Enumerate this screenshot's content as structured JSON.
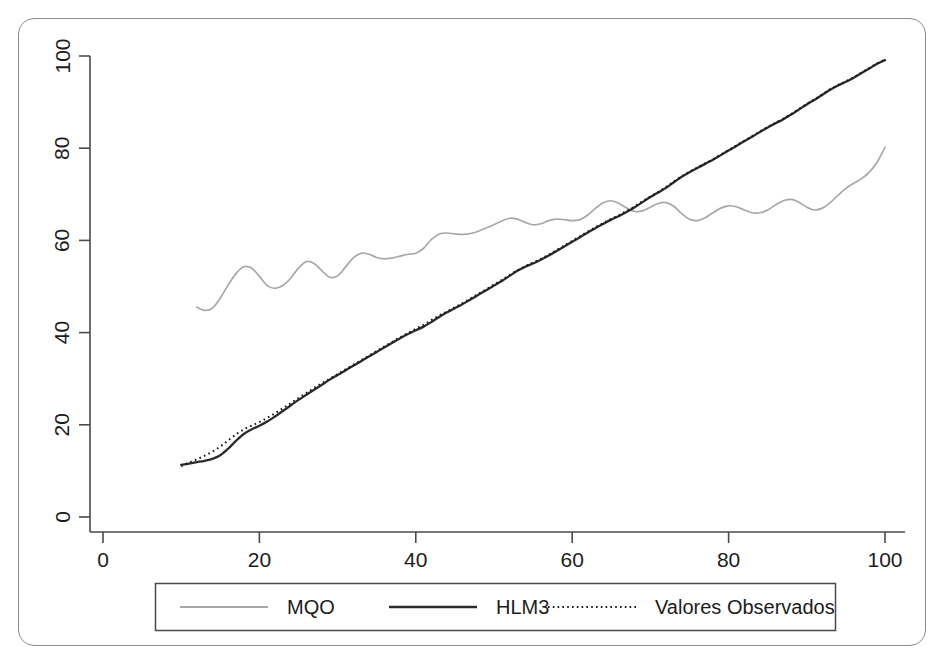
{
  "figure": {
    "background_color": "#ffffff",
    "border_color": "#8d8f92",
    "has_rounded_border": true
  },
  "chart_data": {
    "type": "line",
    "title": "",
    "subtitle": "",
    "xlabel": "",
    "ylabel": "",
    "xlim": [
      0,
      104
    ],
    "ylim": [
      -1,
      103
    ],
    "xticks": [
      0,
      20,
      40,
      60,
      80,
      100
    ],
    "yticks": [
      0,
      20,
      40,
      60,
      80,
      100
    ],
    "xtick_labels": [
      "0",
      "20",
      "40",
      "60",
      "80",
      "100"
    ],
    "ytick_labels": [
      "0",
      "20",
      "40",
      "60",
      "80",
      "100"
    ],
    "grid": false,
    "legend_position": "bottom-outside",
    "legend_entries": [
      "MQO",
      "HLM3",
      "Valores Observados"
    ],
    "series": [
      {
        "name": "MQO",
        "color": "#a8a8a8",
        "style": "solid",
        "x": [
          12.0,
          13.0,
          14.0,
          15.0,
          16.0,
          17.0,
          18.0,
          19.0,
          20.0,
          21.0,
          22.0,
          23.0,
          24.0,
          25.0,
          26.0,
          27.0,
          28.0,
          29.0,
          30.0,
          31.0,
          32.0,
          33.0,
          34.0,
          35.0,
          36.0,
          37.0,
          38.0,
          39.0,
          40.0,
          41.0,
          42.0,
          43.0,
          44.0,
          45.0,
          46.0,
          47.0,
          48.0,
          49.0,
          50.0,
          51.0,
          52.0,
          53.0,
          54.0,
          55.0,
          56.0,
          57.0,
          58.0,
          59.0,
          60.0,
          61.0,
          62.0,
          63.0,
          64.0,
          65.0,
          66.0,
          67.0,
          68.0,
          69.0,
          70.0,
          71.0,
          72.0,
          73.0,
          74.0,
          75.0,
          76.0,
          77.0,
          78.0,
          79.0,
          80.0,
          81.0,
          82.0,
          83.0,
          84.0,
          85.0,
          86.0,
          87.0,
          88.0,
          89.0,
          90.0,
          91.0,
          92.0,
          93.0,
          94.0,
          95.0,
          96.0,
          97.0,
          98.0,
          99.0,
          100.0
        ],
        "y": [
          45.5,
          44.8,
          45.3,
          47.5,
          50.3,
          52.8,
          54.3,
          54.0,
          52.2,
          50.2,
          49.6,
          50.2,
          51.8,
          54.0,
          55.4,
          55.0,
          53.4,
          52.0,
          52.3,
          54.2,
          56.2,
          57.2,
          57.0,
          56.3,
          56.0,
          56.2,
          56.6,
          57.0,
          57.2,
          58.3,
          60.2,
          61.4,
          61.6,
          61.4,
          61.3,
          61.5,
          62.0,
          62.7,
          63.4,
          64.2,
          64.8,
          64.6,
          63.9,
          63.4,
          63.6,
          64.3,
          64.6,
          64.5,
          64.3,
          64.5,
          65.5,
          67.0,
          68.2,
          68.6,
          68.0,
          67.0,
          66.3,
          66.4,
          67.2,
          68.0,
          68.2,
          67.4,
          65.8,
          64.6,
          64.3,
          64.9,
          66.0,
          67.0,
          67.5,
          67.3,
          66.6,
          66.0,
          66.0,
          66.6,
          67.7,
          68.6,
          68.9,
          68.3,
          67.2,
          66.6,
          67.0,
          68.2,
          69.8,
          71.3,
          72.4,
          73.4,
          74.8,
          77.0,
          80.2
        ]
      },
      {
        "name": "HLM3",
        "color": "#2b2b2b",
        "style": "solid",
        "x": [
          10.0,
          11.0,
          12.0,
          13.0,
          14.0,
          15.0,
          16.0,
          17.0,
          18.0,
          19.0,
          20.0,
          21.0,
          22.0,
          23.0,
          24.0,
          25.0,
          26.0,
          27.0,
          28.0,
          29.0,
          30.0,
          31.0,
          32.0,
          33.0,
          34.0,
          35.0,
          36.0,
          37.0,
          38.0,
          39.0,
          40.0,
          41.0,
          42.0,
          43.0,
          44.0,
          45.0,
          46.0,
          47.0,
          48.0,
          49.0,
          50.0,
          51.0,
          52.0,
          53.0,
          54.0,
          55.0,
          56.0,
          57.0,
          58.0,
          59.0,
          60.0,
          61.0,
          62.0,
          63.0,
          64.0,
          65.0,
          66.0,
          67.0,
          68.0,
          69.0,
          70.0,
          71.0,
          72.0,
          73.0,
          74.0,
          75.0,
          76.0,
          77.0,
          78.0,
          79.0,
          80.0,
          81.0,
          82.0,
          83.0,
          84.0,
          85.0,
          86.0,
          87.0,
          88.0,
          89.0,
          90.0,
          91.0,
          92.0,
          93.0,
          94.0,
          95.0,
          96.0,
          97.0,
          98.0,
          99.0,
          100.0
        ],
        "y": [
          11.3,
          11.6,
          11.9,
          12.2,
          12.6,
          13.4,
          14.8,
          16.5,
          18.0,
          19.0,
          19.8,
          20.7,
          21.8,
          23.0,
          24.2,
          25.4,
          26.5,
          27.6,
          28.7,
          29.8,
          30.8,
          31.8,
          32.8,
          33.8,
          34.8,
          35.8,
          36.8,
          37.8,
          38.8,
          39.7,
          40.5,
          41.3,
          42.3,
          43.4,
          44.4,
          45.3,
          46.2,
          47.2,
          48.2,
          49.2,
          50.2,
          51.2,
          52.3,
          53.4,
          54.3,
          55.0,
          55.8,
          56.7,
          57.7,
          58.7,
          59.7,
          60.7,
          61.7,
          62.7,
          63.6,
          64.5,
          65.3,
          66.2,
          67.2,
          68.3,
          69.4,
          70.4,
          71.4,
          72.6,
          73.8,
          74.8,
          75.7,
          76.6,
          77.5,
          78.5,
          79.5,
          80.5,
          81.5,
          82.5,
          83.5,
          84.5,
          85.4,
          86.3,
          87.3,
          88.4,
          89.5,
          90.5,
          91.6,
          92.7,
          93.6,
          94.4,
          95.3,
          96.3,
          97.3,
          98.3,
          99.1
        ]
      },
      {
        "name": "Valores Observados",
        "color": "#1a1a1a",
        "style": "dotted",
        "x": [
          10.0,
          11.0,
          12.0,
          13.0,
          14.0,
          15.0,
          16.0,
          17.0,
          18.0,
          19.0,
          20.0,
          21.0,
          22.0,
          23.0,
          24.0,
          25.0,
          26.0,
          27.0,
          28.0,
          29.0,
          30.0,
          31.0,
          32.0,
          33.0,
          34.0,
          35.0,
          36.0,
          37.0,
          38.0,
          39.0,
          40.0,
          41.0,
          42.0,
          43.0,
          44.0,
          45.0,
          46.0,
          47.0,
          48.0,
          49.0,
          50.0,
          51.0,
          52.0,
          53.0,
          54.0,
          55.0,
          56.0,
          57.0,
          58.0,
          59.0,
          60.0,
          61.0,
          62.0,
          63.0,
          64.0,
          65.0,
          66.0,
          67.0,
          68.0,
          69.0,
          70.0,
          71.0,
          72.0,
          73.0,
          74.0,
          75.0,
          76.0,
          77.0,
          78.0,
          79.0,
          80.0,
          81.0,
          82.0,
          83.0,
          84.0,
          85.0,
          86.0,
          87.0,
          88.0,
          89.0,
          90.0,
          91.0,
          92.0,
          93.0,
          94.0,
          95.0,
          96.0,
          97.0,
          98.0,
          99.0,
          100.0
        ],
        "y": [
          11.0,
          11.8,
          12.5,
          13.3,
          14.2,
          15.3,
          16.6,
          17.9,
          19.0,
          19.8,
          20.6,
          21.5,
          22.5,
          23.6,
          24.7,
          25.8,
          26.9,
          28.0,
          29.0,
          30.0,
          31.0,
          32.0,
          33.0,
          34.0,
          35.0,
          36.0,
          37.0,
          38.0,
          39.0,
          39.9,
          40.8,
          41.7,
          42.7,
          43.7,
          44.6,
          45.5,
          46.4,
          47.4,
          48.4,
          49.4,
          50.4,
          51.4,
          52.5,
          53.5,
          54.4,
          55.2,
          56.0,
          56.9,
          57.9,
          58.9,
          59.9,
          60.9,
          61.9,
          62.9,
          63.8,
          64.7,
          65.5,
          66.4,
          67.4,
          68.5,
          69.5,
          70.5,
          71.6,
          72.8,
          73.9,
          74.9,
          75.8,
          76.7,
          77.6,
          78.6,
          79.6,
          80.6,
          81.6,
          82.6,
          83.6,
          84.6,
          85.5,
          86.4,
          87.4,
          88.5,
          89.6,
          90.6,
          91.7,
          92.8,
          93.7,
          94.5,
          95.4,
          96.4,
          97.4,
          98.4,
          99.2
        ]
      }
    ]
  },
  "legend": {
    "entries": [
      {
        "label": "MQO",
        "style": "solid",
        "color": "#a8a8a8"
      },
      {
        "label": "HLM3",
        "style": "solid",
        "color": "#2b2b2b"
      },
      {
        "label": "Valores Observados",
        "style": "dotted",
        "color": "#1a1a1a"
      }
    ]
  }
}
